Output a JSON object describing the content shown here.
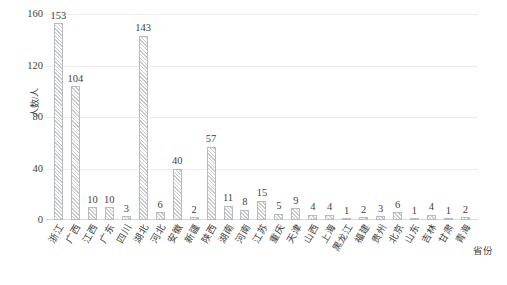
{
  "chart_data": {
    "type": "bar",
    "title": "",
    "subtitle": "",
    "xlabel": "省份",
    "ylabel": "人数/人",
    "ylim": [
      0,
      160
    ],
    "yticks": [
      0,
      40,
      80,
      120,
      160
    ],
    "ytick_labels": [
      "0",
      "40",
      "80",
      "120",
      "160"
    ],
    "grid": true,
    "legend": null,
    "show_value_labels": true,
    "categories": [
      "浙江",
      "广西",
      "江西",
      "广东",
      "四川",
      "湖北",
      "河北",
      "安徽",
      "新疆",
      "陕西",
      "湖南",
      "河南",
      "江苏",
      "重庆",
      "天津",
      "山西",
      "上海",
      "黑龙江",
      "福建",
      "贵州",
      "北京",
      "山东",
      "吉林",
      "甘肃",
      "青海"
    ],
    "values": [
      153,
      104,
      10,
      10,
      3,
      143,
      6,
      40,
      2,
      57,
      11,
      8,
      15,
      5,
      9,
      4,
      4,
      1,
      2,
      3,
      6,
      1,
      4,
      1,
      2
    ],
    "value_labels": [
      "153",
      "104",
      "10",
      "10",
      "3",
      "143",
      "6",
      "40",
      "2",
      "57",
      "11",
      "8",
      "15",
      "5",
      "9",
      "4",
      "4",
      "1",
      "2",
      "3",
      "6",
      "1",
      "4",
      "1",
      "2"
    ],
    "bar_style": {
      "fill": "diagonal-hatch",
      "hatch_color": "#c7cacc",
      "background": "#ffffff",
      "border_color": "#b9bcbe"
    },
    "colors": {
      "gridline": "#eceff1",
      "axis": "#d7d9db",
      "text": "#3f3f3f",
      "plot_background": "#ffffff"
    }
  }
}
